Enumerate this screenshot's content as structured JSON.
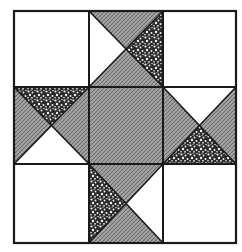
{
  "figure": {
    "title": "Ohio Star quilt block",
    "grid": {
      "rows": 3,
      "cols": 3
    },
    "colors": {
      "background": "#ffffff",
      "outline": "#1a1a1a",
      "plain": "#ffffff",
      "hatch_base": "#a9a9a9",
      "hatch_line": "#5a5a5a",
      "stipple_base": "#f2f2f2",
      "stipple_dot": "#1e1e1e"
    },
    "cells": [
      {
        "row": 0,
        "col": 0,
        "type": "plain"
      },
      {
        "row": 0,
        "col": 1,
        "type": "hourglass",
        "top": "hatch",
        "bottom": "hatch",
        "left": "plain",
        "right": "stipple"
      },
      {
        "row": 0,
        "col": 2,
        "type": "plain"
      },
      {
        "row": 1,
        "col": 0,
        "type": "hourglass",
        "top": "stipple",
        "bottom": "plain",
        "left": "hatch",
        "right": "hatch"
      },
      {
        "row": 1,
        "col": 1,
        "type": "solid",
        "fill": "hatch"
      },
      {
        "row": 1,
        "col": 2,
        "type": "hourglass",
        "top": "plain",
        "bottom": "stipple",
        "left": "hatch",
        "right": "hatch"
      },
      {
        "row": 2,
        "col": 0,
        "type": "plain"
      },
      {
        "row": 2,
        "col": 1,
        "type": "hourglass",
        "top": "hatch",
        "bottom": "hatch",
        "left": "stipple",
        "right": "plain"
      },
      {
        "row": 2,
        "col": 2,
        "type": "plain"
      }
    ]
  }
}
